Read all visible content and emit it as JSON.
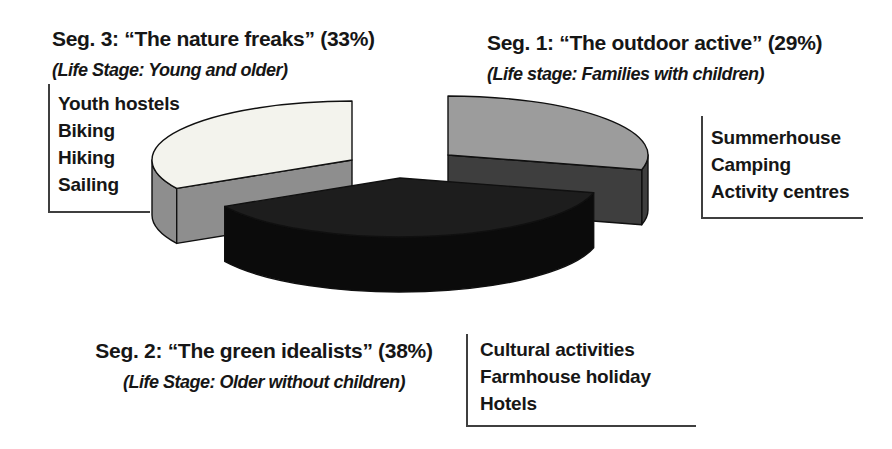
{
  "page": {
    "background": "#ffffff",
    "text_color": "#161616",
    "callout_line_color": "#3f3f3f"
  },
  "chart_data": {
    "type": "pie",
    "style": "3d-exploded",
    "title": "",
    "legend_position": "callout-labels",
    "slices": [
      {
        "id": "seg1",
        "title": "Seg. 1: “The outdoor active” (29%)",
        "subtitle": "(Life stage: Families with children)",
        "segment": "Seg. 1",
        "name": "The outdoor active",
        "percent": 29,
        "life_stage": "Families with children",
        "activities": [
          "Summerhouse",
          "Camping",
          "Activity centres"
        ],
        "top_color": "#9c9c9c",
        "side_color": "#3e3e3e"
      },
      {
        "id": "seg2",
        "title": "Seg. 2: “The green idealists” (38%)",
        "subtitle": "(Life Stage: Older without children)",
        "segment": "Seg. 2",
        "name": "The green idealists",
        "percent": 38,
        "life_stage": "Older without children",
        "activities": [
          "Cultural activities",
          "Farmhouse holiday",
          "Hotels"
        ],
        "top_color": "#1d1d1d",
        "side_color": "#0b0b0b"
      },
      {
        "id": "seg3",
        "title": "Seg. 3: “The nature freaks” (33%)",
        "subtitle": "(Life Stage: Young and older)",
        "segment": "Seg. 3",
        "name": "The nature freaks",
        "percent": 33,
        "life_stage": "Young and older",
        "activities": [
          "Youth hostels",
          "Biking",
          "Hiking",
          "Sailing"
        ],
        "top_color": "#f3f3ed",
        "side_color": "#8e8e8e"
      }
    ],
    "geometry": {
      "rx": 200,
      "ry": 59,
      "depth": 55,
      "start_angle_deg": 90,
      "order_clockwise": [
        "seg1",
        "seg2",
        "seg3"
      ],
      "draw_order": [
        "seg1",
        "seg3",
        "seg2"
      ],
      "centers": {
        "seg1": [
          448,
          155
        ],
        "seg2": [
          400,
          178
        ],
        "seg3": [
          352,
          160
        ]
      },
      "cut_faces": {
        "seg1": "end",
        "seg2": null,
        "seg3": "start"
      },
      "outline_color": "#101010"
    }
  }
}
